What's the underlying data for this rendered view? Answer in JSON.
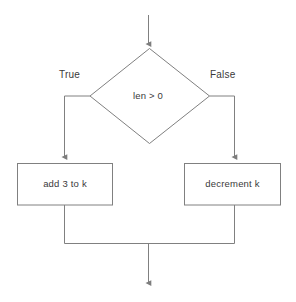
{
  "diagram": {
    "type": "flowchart",
    "title": "",
    "background_color": "#ffffff",
    "line_color": "#808080",
    "text_color": "#3a3a3a",
    "nodes": {
      "decision": {
        "shape": "diamond",
        "label": "len > 0"
      },
      "true_process": {
        "shape": "rectangle",
        "label": "add 3 to k"
      },
      "false_process": {
        "shape": "rectangle",
        "label": "decrement k"
      }
    },
    "edges": {
      "entry": {
        "label": "",
        "arrow": "down-arrow-icon"
      },
      "true_branch": {
        "label": "True",
        "arrow": "down-arrow-icon"
      },
      "false_branch": {
        "label": "False",
        "arrow": "down-arrow-icon"
      },
      "merge_exit": {
        "label": "",
        "arrow": "down-arrow-icon"
      }
    }
  }
}
